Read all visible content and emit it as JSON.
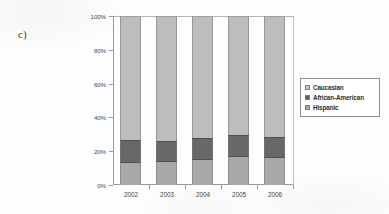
{
  "panel": {
    "label": "c)"
  },
  "legend": {
    "position": "right",
    "entries": [
      {
        "label": "Caucasian",
        "color": "#bdbdbd",
        "icon": "legend-swatch-icon"
      },
      {
        "label": "African-American",
        "color": "#686868",
        "icon": "legend-swatch-icon"
      },
      {
        "label": "Hispanic",
        "color": "#a8a8a8",
        "icon": "legend-swatch-icon"
      }
    ]
  },
  "axes": {
    "y_ticks": [
      "0%",
      "20%",
      "40%",
      "60%",
      "80%",
      "100%"
    ],
    "x_ticks": [
      "2002",
      "2003",
      "2004",
      "2005",
      "2006"
    ]
  },
  "chart_data": {
    "type": "bar",
    "subtype": "stacked-100-percent",
    "title": "",
    "subtitle": "",
    "xlabel": "",
    "ylabel": "",
    "categories": [
      "2002",
      "2003",
      "2004",
      "2005",
      "2006"
    ],
    "series": [
      {
        "name": "Hispanic",
        "color": "#a8a8a8",
        "values": [
          13.0,
          13.5,
          14.5,
          16.5,
          16.0
        ]
      },
      {
        "name": "African-American",
        "color": "#686868",
        "values": [
          13.5,
          12.5,
          13.5,
          13.0,
          12.5
        ]
      },
      {
        "name": "Caucasian",
        "color": "#bdbdbd",
        "values": [
          73.5,
          74.0,
          72.0,
          70.5,
          71.5
        ]
      }
    ],
    "stack_order_bottom_up": [
      "Hispanic",
      "African-American",
      "Caucasian"
    ],
    "cumulative_tops": {
      "Hispanic": [
        13.0,
        13.5,
        14.5,
        16.5,
        16.0
      ],
      "African-American": [
        26.5,
        26.0,
        28.0,
        29.5,
        28.5
      ],
      "Caucasian": [
        100.0,
        100.0,
        100.0,
        100.0,
        100.0
      ]
    },
    "ylim": [
      0,
      100
    ],
    "ytick_values": [
      0,
      20,
      40,
      60,
      80,
      100
    ],
    "ytick_labels": [
      "0%",
      "20%",
      "40%",
      "60%",
      "80%",
      "100%"
    ],
    "grid": false,
    "legend_entries": [
      "Caucasian",
      "African-American",
      "Hispanic"
    ]
  }
}
